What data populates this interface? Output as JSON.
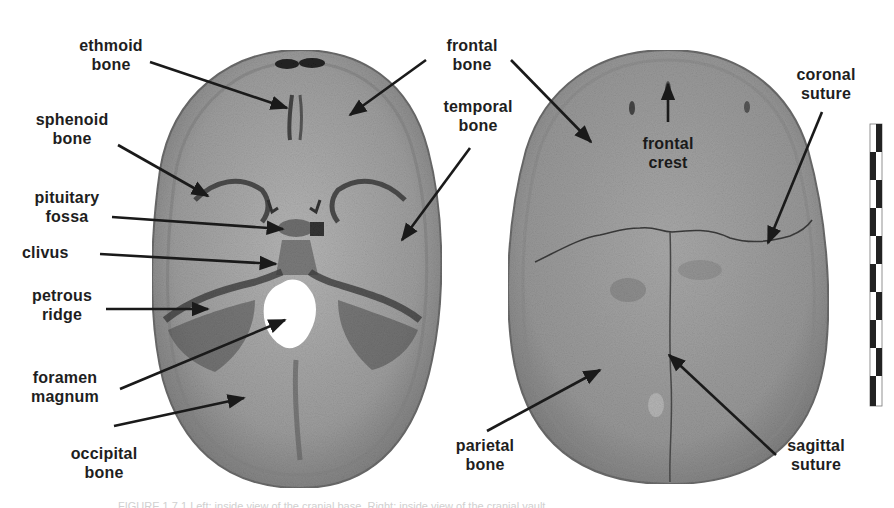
{
  "figure": {
    "left_view": {
      "labels": [
        {
          "id": "ethmoid",
          "line1": "ethmoid",
          "line2": "bone"
        },
        {
          "id": "sphenoid",
          "line1": "sphenoid",
          "line2": "bone"
        },
        {
          "id": "pituitary",
          "line1": "pituitary",
          "line2": "fossa"
        },
        {
          "id": "clivus",
          "line1": "clivus",
          "line2": ""
        },
        {
          "id": "petrous",
          "line1": "petrous",
          "line2": "ridge"
        },
        {
          "id": "foramen",
          "line1": "foramen",
          "line2": "magnum"
        },
        {
          "id": "occipital",
          "line1": "occipital",
          "line2": "bone"
        },
        {
          "id": "frontal_left",
          "line1": "frontal",
          "line2": "bone"
        },
        {
          "id": "temporal",
          "line1": "temporal",
          "line2": "bone"
        }
      ]
    },
    "right_view": {
      "labels": [
        {
          "id": "frontal_crest",
          "line1": "frontal",
          "line2": "crest"
        },
        {
          "id": "coronal",
          "line1": "coronal",
          "line2": "suture"
        },
        {
          "id": "parietal",
          "line1": "parietal",
          "line2": "bone"
        },
        {
          "id": "sagittal",
          "line1": "sagittal",
          "line2": "suture"
        }
      ]
    },
    "scale_bar": {
      "segments": 10
    },
    "caption": "FIGURE 1.7.1 Left: inside view of the cranial base. Right: inside view of the cranial vault."
  },
  "colors": {
    "bone_light": "#a9a9a9",
    "bone_dark": "#5e5e5e",
    "text": "#1e1e1e",
    "arrow": "#1a1a1a"
  }
}
